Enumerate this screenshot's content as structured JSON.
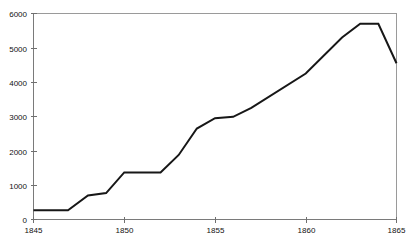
{
  "chart_data": {
    "type": "line",
    "title": "",
    "subtitle": "",
    "xlabel": "",
    "ylabel": "",
    "xlim": [
      1845,
      1865
    ],
    "ylim": [
      0,
      6000
    ],
    "grid": false,
    "legend": null,
    "legend_position": "none",
    "x_ticks": [
      1845,
      1850,
      1855,
      1860,
      1865
    ],
    "x_tick_labels": [
      "1845",
      "1850",
      "1855",
      "1860",
      "1865"
    ],
    "y_ticks": [
      0,
      1000,
      2000,
      3000,
      4000,
      5000,
      6000
    ],
    "y_tick_labels": [
      "0",
      "1000",
      "2000",
      "3000",
      "4000",
      "5000",
      "6000"
    ],
    "series": [
      {
        "name": "",
        "color": "#171717",
        "x": [
          1845.0,
          1846.9,
          1848.0,
          1849.0,
          1850.0,
          1852.0,
          1853.0,
          1854.0,
          1855.0,
          1856.0,
          1857.0,
          1860.0,
          1862.0,
          1863.0,
          1864.0,
          1865.0
        ],
        "values": [
          270,
          270,
          700,
          770,
          1370,
          1370,
          1880,
          2650,
          2950,
          2990,
          3250,
          4250,
          5300,
          5700,
          5700,
          4550
        ]
      }
    ]
  },
  "axes": {
    "x_axis_name": "x-axis",
    "y_axis_name": "y-axis"
  },
  "style": {
    "line_color": "#171717",
    "axis_color": "#7a7a7a",
    "frame_color": "#9a9a9a",
    "tick_color": "#6f6f6f",
    "label_color": "#111111",
    "background": "#ffffff"
  }
}
